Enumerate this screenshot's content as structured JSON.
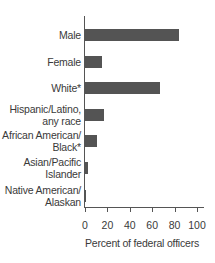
{
  "chart_data": {
    "type": "bar",
    "orientation": "horizontal",
    "title": "",
    "categories": [
      "Male",
      "Female",
      "White*",
      "Hispanic/Latino, any race",
      "African American/ Black*",
      "Asian/Pacific Islander",
      "Native American/ Alaskan"
    ],
    "category_lines": [
      [
        "Male"
      ],
      [
        "Female"
      ],
      [
        "White*"
      ],
      [
        "Hispanic/Latino,",
        "any race"
      ],
      [
        "African American/",
        "Black*"
      ],
      [
        "Asian/Pacific",
        "Islander"
      ],
      [
        "Native American/",
        "Alaskan"
      ]
    ],
    "values": [
      84,
      15,
      67,
      17,
      11,
      3,
      1
    ],
    "xlabel": "Percent of federal officers",
    "ylabel": "",
    "xlim": [
      0,
      100
    ],
    "xticks": [
      "0",
      "20",
      "40",
      "60",
      "80",
      "100"
    ],
    "grid": false,
    "legend": null,
    "bar_color": "#545454"
  }
}
